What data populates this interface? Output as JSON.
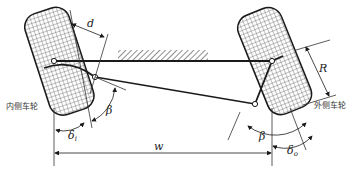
{
  "diagram": {
    "type": "Ackermann steering geometry",
    "labels": {
      "inner_wheel": "内侧车轮",
      "outer_wheel": "外侧车轮",
      "d": "d",
      "R": "R",
      "w": "w",
      "beta_left": "β",
      "beta_right": "β",
      "delta": "δ",
      "delta_i_sub": "i",
      "delta_o_sub": "o"
    },
    "colors": {
      "line": "#1a1a1a",
      "hatch": "#444444",
      "tire_mesh": "#333333",
      "background": "#ffffff"
    }
  }
}
